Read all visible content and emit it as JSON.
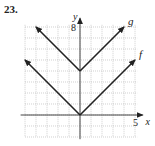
{
  "problem_number": "23.",
  "chart_data": {
    "type": "line",
    "title": "",
    "xlabel": "x",
    "ylabel": "y",
    "xlim": [
      -5,
      5
    ],
    "ylim": [
      -2,
      8
    ],
    "grid": true,
    "x_tick_labels": [
      "5"
    ],
    "y_tick_labels": [
      "8"
    ],
    "series": [
      {
        "name": "g",
        "x": [
          -4,
          0,
          4
        ],
        "y": [
          8,
          4,
          8
        ]
      },
      {
        "name": "f",
        "x": [
          -5,
          0,
          5
        ],
        "y": [
          5,
          0,
          5
        ]
      }
    ]
  }
}
